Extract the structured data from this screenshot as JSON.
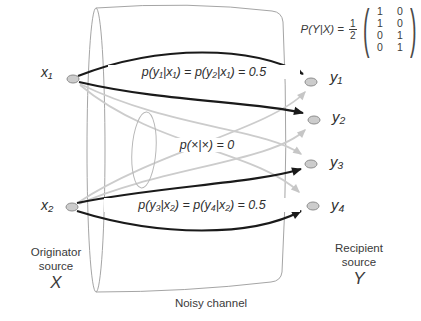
{
  "nodes": {
    "x1": "x₁",
    "x2": "x₂",
    "y1": "y₁",
    "y2": "y₂",
    "y3": "y₃",
    "y4": "y₄"
  },
  "edge_labels": {
    "x1_pair": "p(y₁|x₁) = p(y₂|x₁) = 0.5",
    "zero": "p(×|×) = 0",
    "x2_pair": "p(y₃|x₂) = p(y₄|x₂) = 0.5"
  },
  "formula": {
    "lhs": "P(Y|X) =",
    "frac_num": "1",
    "frac_den": "2",
    "lparen": "(",
    "rparen": ")",
    "matrix": [
      [
        "1",
        "0"
      ],
      [
        "1",
        "0"
      ],
      [
        "0",
        "1"
      ],
      [
        "0",
        "1"
      ]
    ]
  },
  "captions": {
    "originator_line1": "Originator",
    "originator_line2": "source",
    "originator_symbol": "X",
    "recipient_line1": "Recipient",
    "recipient_line2": "source",
    "recipient_symbol": "Y",
    "channel": "Noisy channel"
  },
  "edges": [
    {
      "from": "x1",
      "to": "y1",
      "p": "0.5"
    },
    {
      "from": "x1",
      "to": "y2",
      "p": "0.5"
    },
    {
      "from": "x2",
      "to": "y3",
      "p": "0.5"
    },
    {
      "from": "x2",
      "to": "y4",
      "p": "0.5"
    },
    {
      "from": "x1",
      "to": "y3",
      "p": "0"
    },
    {
      "from": "x1",
      "to": "y4",
      "p": "0"
    },
    {
      "from": "x2",
      "to": "y1",
      "p": "0"
    },
    {
      "from": "x2",
      "to": "y2",
      "p": "0"
    }
  ],
  "colors": {
    "active_edge": "#1a1a1a",
    "zero_edge": "#cccccc",
    "node_fill": "#cccccc",
    "node_stroke": "#8d8d8d",
    "cylinder_stroke": "#a5a5a5",
    "text": "#333333"
  }
}
